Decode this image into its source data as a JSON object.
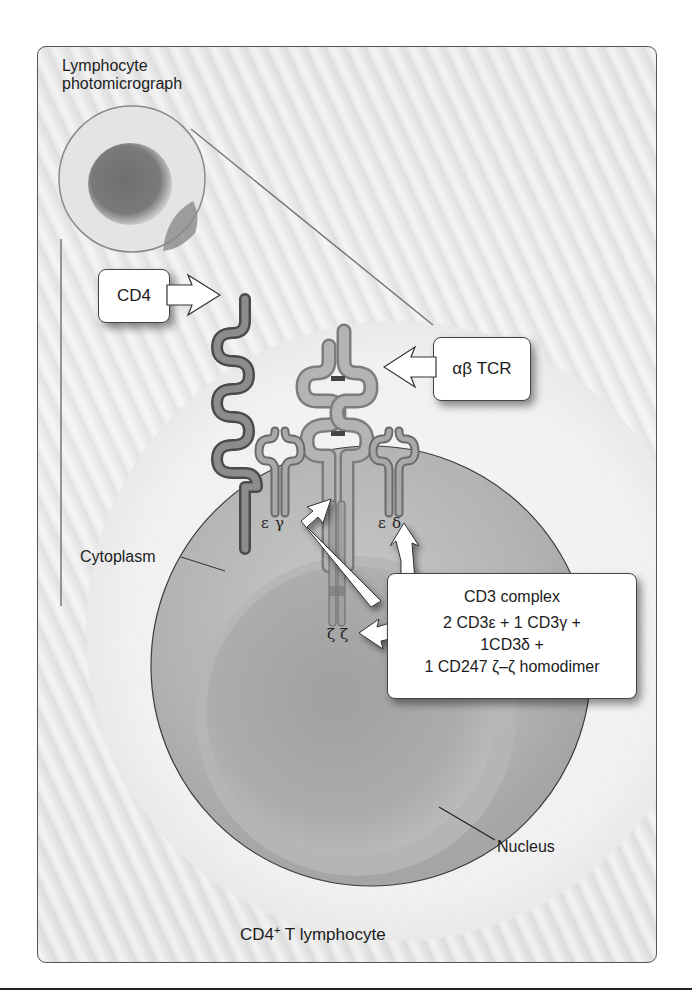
{
  "figure": {
    "photomicrograph_label_line1": "Lymphocyte",
    "photomicrograph_label_line2": "photomicrograph",
    "cd4_label": "CD4",
    "tcr_label": "αβ TCR",
    "cytoplasm_label": "Cytoplasm",
    "nucleus_label": "Nucleus",
    "cell_title": "CD4",
    "cell_title_sup": "+",
    "cell_title_rest": " T lymphocyte",
    "chain_labels": {
      "epsilon_left": "ε",
      "gamma": "γ",
      "epsilon_right": "ε",
      "delta": "δ",
      "zeta_pair": "ζ ζ"
    },
    "cd3_callout": {
      "title": "CD3 complex",
      "line1": "2 CD3ε + 1 CD3γ +",
      "line2": "1CD3δ +",
      "line3": "1 CD247 ζ–ζ homodimer"
    }
  },
  "colors": {
    "panel_border": "#555555",
    "cd4_molecule": "#6e6e6e",
    "tcr_molecule": "#a8a8a8",
    "cd3_molecule": "#8c8c8c",
    "cytoplasm": "#b9b9b9",
    "nucleus": "#a6a6a6",
    "callout_fill": "#ffffff"
  }
}
